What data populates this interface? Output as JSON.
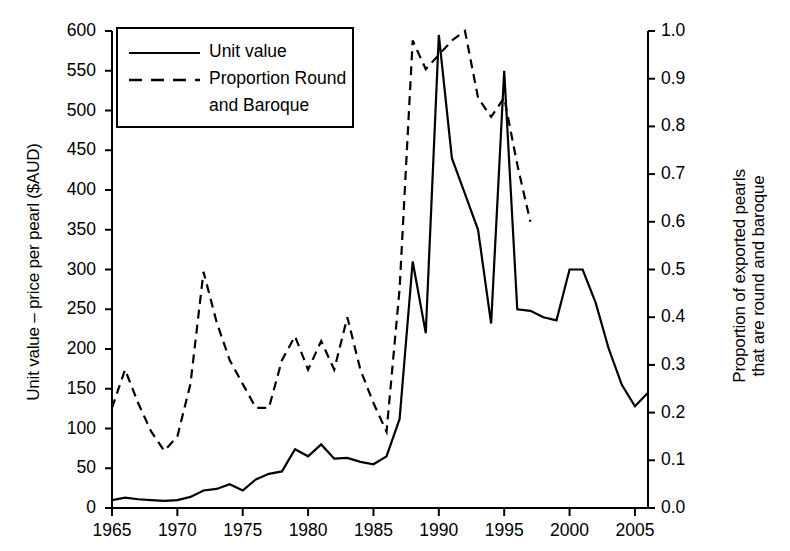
{
  "figure": {
    "background_color": "#ffffff",
    "line_color": "#000000"
  },
  "axes": {
    "left": {
      "label": "Unit value – price per pearl ($AUD)",
      "ticks": [
        "0",
        "50",
        "100",
        "150",
        "200",
        "250",
        "300",
        "350",
        "400",
        "450",
        "500",
        "550",
        "600"
      ],
      "min": 0,
      "max": 600
    },
    "right": {
      "label_line1": "Proportion of exported pearls",
      "label_line2": "that are round and baroque",
      "ticks": [
        "0.0",
        "0.1",
        "0.2",
        "0.3",
        "0.4",
        "0.5",
        "0.6",
        "0.7",
        "0.8",
        "0.9",
        "1.0"
      ],
      "min": 0,
      "max": 1
    },
    "bottom": {
      "label": "",
      "ticks": [
        "1965",
        "1970",
        "1975",
        "1980",
        "1985",
        "1990",
        "1995",
        "2000",
        "2005"
      ],
      "min": 1965,
      "max": 2006
    }
  },
  "legend": {
    "items": [
      {
        "label": "Unit value",
        "style": "solid"
      },
      {
        "label": "Proportion Round",
        "style": "dashed"
      },
      {
        "label": "and Baroque",
        "style": "none"
      }
    ]
  },
  "chart_data": {
    "type": "line",
    "title": "",
    "xlabel": "",
    "ylabel": "Unit value – price per pearl ($AUD)",
    "ylabel_secondary": "Proportion of exported pearls that are round and baroque",
    "xlim": [
      1965,
      2006
    ],
    "ylim": [
      0,
      600
    ],
    "ylim_secondary": [
      0.0,
      1.0
    ],
    "grid": false,
    "legend_position": "upper-left",
    "x": [
      1965,
      1966,
      1967,
      1968,
      1969,
      1970,
      1971,
      1972,
      1973,
      1974,
      1975,
      1976,
      1977,
      1978,
      1979,
      1980,
      1981,
      1982,
      1983,
      1984,
      1985,
      1986,
      1987,
      1988,
      1989,
      1990,
      1991,
      1992,
      1993,
      1994,
      1995,
      1996,
      1997,
      1998,
      1999,
      2000,
      2001,
      2002,
      2003,
      2004,
      2005,
      2006
    ],
    "series": [
      {
        "name": "Unit value",
        "axis": "left",
        "style": "solid",
        "units": "$AUD per pearl",
        "values": [
          10,
          13,
          11,
          10,
          9,
          10,
          14,
          22,
          24,
          30,
          22,
          36,
          43,
          46,
          74,
          65,
          80,
          62,
          63,
          58,
          55,
          65,
          112,
          310,
          220,
          595,
          440,
          395,
          350,
          232,
          550,
          250,
          248,
          240,
          236,
          300,
          300,
          258,
          200,
          155,
          128,
          145
        ]
      },
      {
        "name": "Proportion Round and Baroque",
        "axis": "right",
        "style": "dashed",
        "units": "proportion",
        "values": [
          0.21,
          0.29,
          0.22,
          0.16,
          0.12,
          0.15,
          0.26,
          0.495,
          0.39,
          0.31,
          0.26,
          0.21,
          0.21,
          0.31,
          0.36,
          0.29,
          0.35,
          0.29,
          0.4,
          0.29,
          0.22,
          0.16,
          0.46,
          0.98,
          0.92,
          0.95,
          0.98,
          1.0,
          0.86,
          0.82,
          0.86,
          0.72,
          0.6,
          null,
          null,
          null,
          null,
          null,
          null,
          null,
          null,
          null
        ]
      }
    ]
  }
}
